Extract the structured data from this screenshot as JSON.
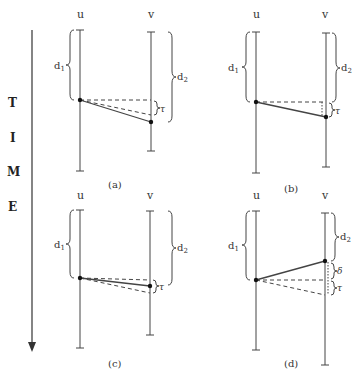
{
  "time_axis": {
    "letters": [
      "T",
      "I",
      "M",
      "E"
    ]
  },
  "panels": [
    {
      "id": "a",
      "caption": "(a)",
      "process_left": "u",
      "process_right": "v",
      "delay_left": "d",
      "delay_left_sub": "1",
      "delay_right": "d",
      "delay_right_sub": "2",
      "interval_label": "τ"
    },
    {
      "id": "b",
      "caption": "(b)",
      "process_left": "u",
      "process_right": "v",
      "delay_left": "d",
      "delay_left_sub": "1",
      "delay_right": "d",
      "delay_right_sub": "2",
      "interval_label": "τ"
    },
    {
      "id": "c",
      "caption": "(c)",
      "process_left": "u",
      "process_right": "v",
      "delay_left": "d",
      "delay_left_sub": "1",
      "delay_right": "d",
      "delay_right_sub": "2",
      "interval_label": "τ"
    },
    {
      "id": "d",
      "caption": "(d)",
      "process_left": "u",
      "process_right": "v",
      "delay_left": "d",
      "delay_left_sub": "1",
      "delay_right": "d",
      "delay_right_sub": "2",
      "interval_label": "τ",
      "extra_label": "δ"
    }
  ]
}
